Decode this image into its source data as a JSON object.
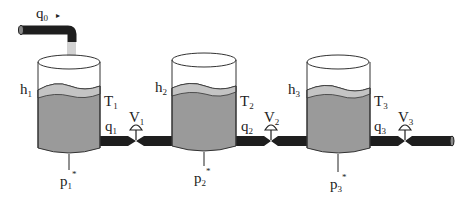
{
  "diagram": {
    "colors": {
      "liquid_body": "#9a9a9a",
      "liquid_surface": "#c4c4c4",
      "pipe": "#1e1e1e",
      "inflow_stream": "#d2d2d2",
      "outline": "#333333",
      "background": "#ffffff"
    },
    "inflow": {
      "label": "q",
      "sub": "0",
      "arrow": "▸"
    },
    "tanks": [
      {
        "level_label": "h",
        "level_sub": "1",
        "tank_label": "T",
        "tank_sub": "1",
        "flow_label": "q",
        "flow_sub": "1",
        "valve_label": "V",
        "valve_sub": "1",
        "pressure_label": "p",
        "pressure_sub": "1",
        "pressure_sup": "*"
      },
      {
        "level_label": "h",
        "level_sub": "2",
        "tank_label": "T",
        "tank_sub": "2",
        "flow_label": "q",
        "flow_sub": "2",
        "valve_label": "V",
        "valve_sub": "2",
        "pressure_label": "p",
        "pressure_sub": "2",
        "pressure_sup": "*"
      },
      {
        "level_label": "h",
        "level_sub": "3",
        "tank_label": "T",
        "tank_sub": "3",
        "flow_label": "q",
        "flow_sub": "3",
        "valve_label": "V",
        "valve_sub": "3",
        "pressure_label": "p",
        "pressure_sub": "3",
        "pressure_sup": "*"
      }
    ]
  }
}
